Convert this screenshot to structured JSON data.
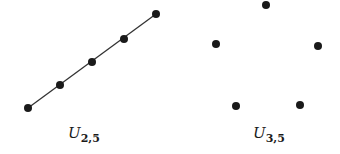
{
  "figure": {
    "left": {
      "label_main": "U",
      "label_sub": "2,5",
      "points": [
        [
          28,
          108
        ],
        [
          60,
          85
        ],
        [
          92,
          62
        ],
        [
          124,
          39
        ],
        [
          156,
          14
        ]
      ],
      "connected": true
    },
    "right": {
      "label_main": "U",
      "label_sub": "3,5",
      "points": [
        [
          266,
          5
        ],
        [
          216,
          44
        ],
        [
          318,
          46
        ],
        [
          236,
          106
        ],
        [
          300,
          105
        ]
      ],
      "connected": false
    },
    "colors": {
      "point": "#1a1a1a",
      "line": "#333333"
    }
  }
}
